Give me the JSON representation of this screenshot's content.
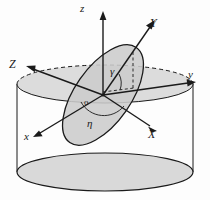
{
  "figure": {
    "kind": "3d-geometry-diagram",
    "colors": {
      "stroke": "#1a1a1a",
      "cylinder_fill": "#d9d9d9",
      "disk_fill": "#cccccc",
      "top_ellipse_fill": "#dcdcdc",
      "background": "#fdfdfd"
    }
  },
  "labels": {
    "z_axis": "z",
    "y_axis": "y",
    "x_axis": "x",
    "X_axis": "X",
    "Y_axis": "Y",
    "Z_axis": "Z",
    "origin": "o",
    "angle_gamma": "γ",
    "angle_eta": "η"
  },
  "elements": {
    "cylinder_top_ellipse": "cylinder-top-ellipse",
    "cylinder_bottom_ellipse": "cylinder-bottom-ellipse",
    "cylinder_left_wall": "cylinder-left-wall",
    "cylinder_right_wall": "cylinder-right-wall",
    "inclined_disk": "inclined-disk",
    "gamma_arc": "gamma-angle-arc",
    "eta_arc": "eta-angle-arc",
    "dashed_drop_line": "dashed-drop-line",
    "dashed_projection_line": "dashed-projection-line"
  }
}
